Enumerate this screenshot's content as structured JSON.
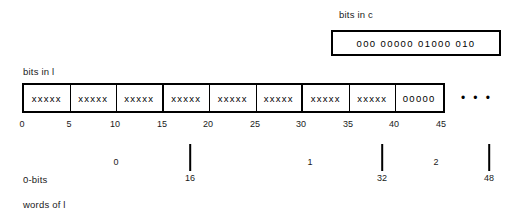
{
  "diagram": {
    "c_section": {
      "label": "bits in c",
      "bits": "000 00000 01000 010"
    },
    "l_section": {
      "label": "bits in l",
      "cells": [
        {
          "bits": "xxxxx",
          "word_boundary": false
        },
        {
          "bits": "xxxxx",
          "word_boundary": false
        },
        {
          "bits": "xxxxx",
          "word_boundary": true
        },
        {
          "bits": "xxxxx",
          "word_boundary": false
        },
        {
          "bits": "xxxxx",
          "word_boundary": false
        },
        {
          "bits": "xxxxx",
          "word_boundary": true
        },
        {
          "bits": "xxxxx",
          "word_boundary": false
        },
        {
          "bits": "xxxxx",
          "word_boundary": false
        },
        {
          "bits": "00000",
          "word_boundary": false
        }
      ],
      "ellipsis": "• • •"
    },
    "bit_ruler": {
      "ticks": [
        {
          "label": "0",
          "x": 22
        },
        {
          "label": "5",
          "x": 69
        },
        {
          "label": "10",
          "x": 115
        },
        {
          "label": "15",
          "x": 162
        },
        {
          "label": "20",
          "x": 208
        },
        {
          "label": "25",
          "x": 255
        },
        {
          "label": "30",
          "x": 301
        },
        {
          "label": "35",
          "x": 348
        },
        {
          "label": "40",
          "x": 394
        },
        {
          "label": "45",
          "x": 441
        }
      ]
    },
    "word_ruler": {
      "ticks": [
        {
          "label": "16",
          "x": 190
        },
        {
          "label": "32",
          "x": 382
        },
        {
          "label": "48",
          "x": 489
        }
      ],
      "word_numbers": [
        {
          "label": "0",
          "x": 116
        },
        {
          "label": "1",
          "x": 310
        },
        {
          "label": "2",
          "x": 436
        }
      ]
    },
    "row_labels": {
      "zero_bits": "0-bits",
      "words_of_l": "words of l"
    }
  }
}
